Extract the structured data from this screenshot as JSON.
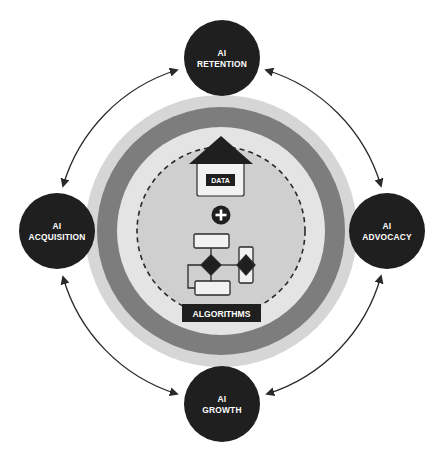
{
  "diagram": {
    "center": {
      "data_label": "DATA",
      "plus_symbol": "+",
      "algorithms_label": "ALGORITHMS"
    },
    "nodes": [
      {
        "id": "retention",
        "line1": "AI",
        "line2": "RETENTION"
      },
      {
        "id": "advocacy",
        "line1": "AI",
        "line2": "ADVOCACY"
      },
      {
        "id": "growth",
        "line1": "AI",
        "line2": "GROWTH"
      },
      {
        "id": "acquisition",
        "line1": "AI",
        "line2": "ACQUISITION"
      }
    ],
    "connections": [
      {
        "from": "retention",
        "to": "advocacy",
        "bidirectional": true
      },
      {
        "from": "advocacy",
        "to": "growth",
        "bidirectional": true
      },
      {
        "from": "growth",
        "to": "acquisition",
        "bidirectional": true
      },
      {
        "from": "acquisition",
        "to": "retention",
        "bidirectional": true
      }
    ],
    "colors": {
      "node_fill": "#1f1f1f",
      "outer_ring": "#d6d6d6",
      "middle_band": "#7d7d7d",
      "inner_ring": "#e4e4e4",
      "inner_disk": "#cfcfcf",
      "house_roof": "#1f1f1f",
      "house_body": "#f2f2f2",
      "arrow": "#2a2a2a"
    }
  }
}
